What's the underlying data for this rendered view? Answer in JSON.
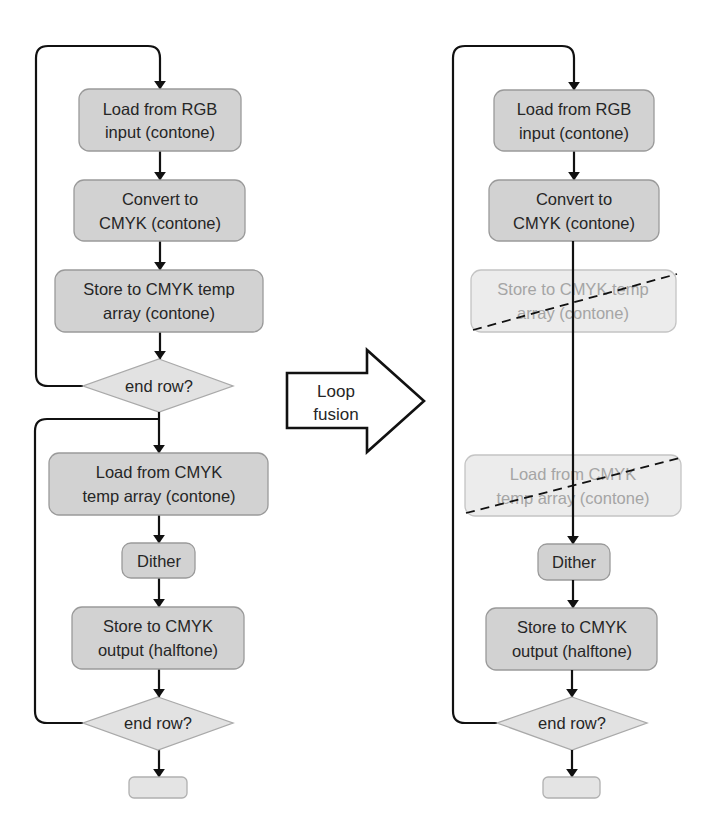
{
  "diagram": {
    "title": "",
    "transform": {
      "label_line1": "Loop",
      "label_line2": "fusion"
    },
    "before": {
      "nodes": [
        {
          "id": "load-rgb",
          "type": "process",
          "line1": "Load from RGB",
          "line2": "input (contone)"
        },
        {
          "id": "convert-cmyk",
          "type": "process",
          "line1": "Convert to",
          "line2": "CMYK (contone)"
        },
        {
          "id": "store-temp",
          "type": "process",
          "line1": "Store to CMYK temp",
          "line2": "array (contone)"
        },
        {
          "id": "end-row-1",
          "type": "decision",
          "label": "end row?"
        },
        {
          "id": "load-temp",
          "type": "process",
          "line1": "Load from CMYK",
          "line2": "temp array (contone)"
        },
        {
          "id": "dither",
          "type": "process",
          "label": "Dither"
        },
        {
          "id": "store-output",
          "type": "process",
          "line1": "Store to CMYK",
          "line2": "output (halftone)"
        },
        {
          "id": "end-row-2",
          "type": "decision",
          "label": "end row?"
        },
        {
          "id": "terminal",
          "type": "terminal",
          "label": ""
        }
      ]
    },
    "after": {
      "nodes": [
        {
          "id": "load-rgb",
          "type": "process",
          "line1": "Load from RGB",
          "line2": "input (contone)"
        },
        {
          "id": "convert-cmyk",
          "type": "process",
          "line1": "Convert to",
          "line2": "CMYK (contone)"
        },
        {
          "id": "store-temp",
          "type": "removed",
          "line1": "Store to CMYK temp",
          "line2": "array (contone)"
        },
        {
          "id": "load-temp",
          "type": "removed",
          "line1": "Load from CMYK",
          "line2": "temp array (contone)"
        },
        {
          "id": "dither",
          "type": "process",
          "label": "Dither"
        },
        {
          "id": "store-output",
          "type": "process",
          "line1": "Store to CMYK",
          "line2": "output (halftone)"
        },
        {
          "id": "end-row",
          "type": "decision",
          "label": "end row?"
        },
        {
          "id": "terminal",
          "type": "terminal",
          "label": ""
        }
      ]
    },
    "colors": {
      "box_fill": "#d2d2d2",
      "removed_box_fill": "#ececec",
      "decision_fill": "#e2e2e2",
      "line": "#111111"
    }
  }
}
